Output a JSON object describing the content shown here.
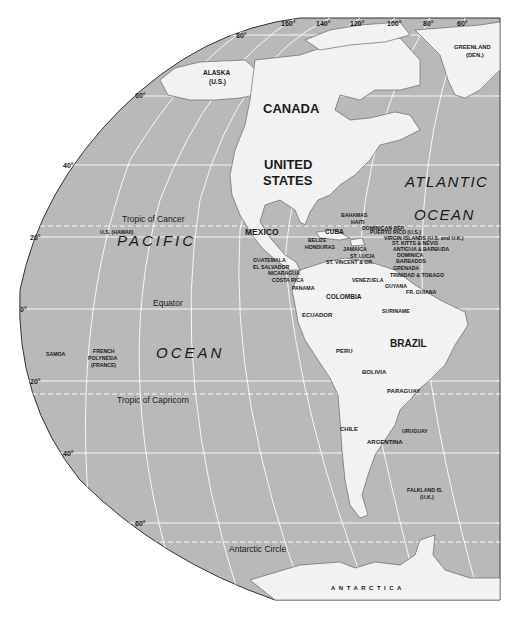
{
  "map": {
    "title": "The Americas",
    "colors": {
      "water": "#b9b9b9",
      "land": "#f2f2f2",
      "grid": "#ffffff",
      "border": "#333333",
      "text": "#1a1a1a"
    },
    "longitude_labels": [
      "160°",
      "140°",
      "120°",
      "100°",
      "80°",
      "60°"
    ],
    "latitude_labels": {
      "lat80": "80°",
      "lat60n": "60°",
      "lat40n": "40°",
      "lat20n": "20°",
      "lat0": "0°",
      "lat20s": "20°",
      "lat40s": "40°",
      "lat60s": "60°"
    },
    "special_lines": {
      "tropic_cancer": "Tropic of Cancer",
      "equator": "Equator",
      "tropic_capricorn": "Tropic of Capricorn",
      "antarctic_circle": "Antarctic Circle"
    },
    "oceans": {
      "pacific_1": "PACIFIC",
      "pacific_2": "OCEAN",
      "atlantic_1": "ATLANTIC",
      "atlantic_2": "OCEAN"
    },
    "major_countries": {
      "canada": "CANADA",
      "us_1": "UNITED",
      "us_2": "STATES",
      "mexico": "MEXICO",
      "brazil": "BRAZIL"
    },
    "territories": {
      "alaska_1": "ALASKA",
      "alaska_2": "(U.S.)",
      "greenland_1": "GREENLAND",
      "greenland_2": "(DEN.)",
      "hawaii": "U.S. (HAWAII)",
      "samoa": "SAMOA",
      "fp_1": "FRENCH",
      "fp_2": "POLYNESIA",
      "fp_3": "(FRANCE)",
      "falkland_1": "FALKLAND IS.",
      "falkland_2": "(U.K.)",
      "antarctica": "ANTARCTICA"
    },
    "caribbean": {
      "bahamas": "BAHAMAS",
      "haiti": "HAITI",
      "cuba": "CUBA",
      "dominican": "DOMINICAN REP.",
      "puerto_rico": "PUERTO RICO (U.S.)",
      "virgin": "VIRGIN ISLANDS (U.S. and U.K.)",
      "st_kitts": "ST. KITTS & NEVIS",
      "antigua": "ANTIGUA & BARBUDA",
      "dominica": "DOMINICA",
      "barbados": "BARBADOS",
      "grenada": "GRENADA",
      "trinidad": "TRINIDAD & TOBAGO",
      "jamaica": "JAMAICA",
      "st_lucia": "ST. LUCIA",
      "st_vincent": "ST. VINCENT & GR.",
      "belize": "BELIZE",
      "honduras": "HONDURAS"
    },
    "central_america": {
      "guatemala": "GUATEMALA",
      "el_salvador": "EL SALVADOR",
      "nicaragua": "NICARAGUA",
      "costa_rica": "COSTA RICA",
      "panama": "PANAMA"
    },
    "south_america": {
      "venezuela": "VENEZUELA",
      "guyana": "GUYANA",
      "fr_guiana": "FR. GUIANA",
      "suriname": "SURINAME",
      "colombia": "COLOMBIA",
      "ecuador": "ECUADOR",
      "peru": "PERU",
      "bolivia": "BOLIVIA",
      "paraguay": "PARAGUAY",
      "uruguay": "URUGUAY",
      "chile": "CHILE",
      "argentina": "ARGENTINA"
    }
  }
}
